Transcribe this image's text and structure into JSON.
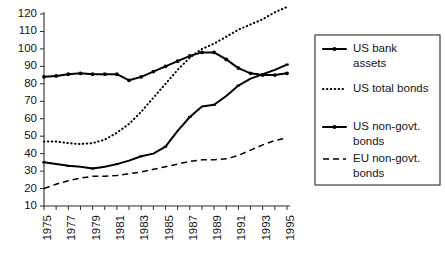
{
  "chart_data": {
    "type": "line",
    "title": "",
    "xlabel": "",
    "ylabel": "",
    "xlim": [
      1975,
      1995
    ],
    "ylim": [
      10,
      120
    ],
    "grid": false,
    "legend_position": "right",
    "x": [
      1975,
      1976,
      1977,
      1978,
      1979,
      1980,
      1981,
      1982,
      1983,
      1984,
      1985,
      1986,
      1987,
      1988,
      1989,
      1990,
      1991,
      1992,
      1993,
      1994,
      1995
    ],
    "xtick_labels": [
      "1975",
      "1977",
      "1979",
      "1981",
      "1983",
      "1985",
      "1987",
      "1989",
      "1991",
      "1993",
      "1995"
    ],
    "xtick_values": [
      1975,
      1977,
      1979,
      1981,
      1983,
      1985,
      1987,
      1989,
      1991,
      1993,
      1995
    ],
    "ytick_labels": [
      "10",
      "20",
      "30",
      "40",
      "50",
      "60",
      "70",
      "80",
      "90",
      "100",
      "110",
      "120"
    ],
    "ytick_values": [
      10,
      20,
      30,
      40,
      50,
      60,
      70,
      80,
      90,
      100,
      110,
      120
    ],
    "series": [
      {
        "name": "US bank assets",
        "style": "solid-markers",
        "values": [
          84,
          84.5,
          85.5,
          86,
          85.5,
          85.5,
          85.5,
          82,
          84,
          87,
          90,
          93,
          96,
          98,
          98,
          94,
          89,
          86,
          85,
          85,
          86
        ]
      },
      {
        "name": "US total bonds",
        "style": "dotted",
        "values": [
          47,
          47,
          46,
          45.5,
          46,
          48,
          52,
          57,
          64,
          72,
          80,
          88,
          95,
          100,
          103,
          107,
          111,
          114,
          117,
          121,
          124
        ]
      },
      {
        "name": "US non-govt. bonds",
        "style": "solid",
        "values": [
          35,
          34,
          33,
          32.5,
          31.5,
          32.5,
          34,
          36,
          38.5,
          40,
          44,
          53,
          61,
          67,
          68,
          73,
          79,
          83,
          85.5,
          88,
          91
        ]
      },
      {
        "name": "EU non-govt. bonds",
        "style": "dashed",
        "values": [
          20,
          22.5,
          24.5,
          26,
          27,
          27,
          27.5,
          28.5,
          29.5,
          31,
          32.5,
          34,
          35.5,
          36.5,
          36.5,
          37,
          39,
          42,
          45,
          47.5,
          49
        ]
      }
    ]
  },
  "legend": {
    "entries": [
      {
        "label_line1": "US bank",
        "label_line2": "assets",
        "style": "solid-markers"
      },
      {
        "label_line1": "US total bonds",
        "label_line2": "",
        "style": "dotted"
      },
      {
        "label_line1": "US non-govt.",
        "label_line2": "bonds",
        "style": "solid"
      },
      {
        "label_line1": "EU non-govt.",
        "label_line2": "bonds",
        "style": "dashed"
      }
    ]
  },
  "colors": {
    "foreground": "#000000",
    "axis": "#2b2b2b",
    "background": "#ffffff"
  }
}
